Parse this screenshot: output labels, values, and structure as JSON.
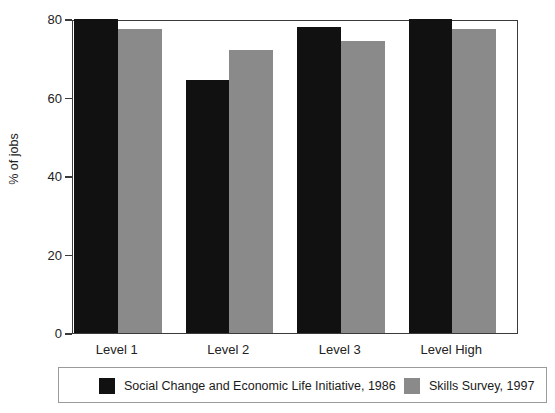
{
  "chart_data": {
    "type": "bar",
    "title": "",
    "subtitle": "",
    "xlabel": "",
    "ylabel": "% of jobs",
    "categories": [
      "Level 1",
      "Level 2",
      "Level 3",
      "Level High"
    ],
    "series": [
      {
        "name": "Social Change and Economic Life Initiative, 1986",
        "color": "#111111",
        "values": [
          80,
          64.5,
          78,
          80
        ]
      },
      {
        "name": "Skills Survey, 1997",
        "color": "#8a8a8a",
        "values": [
          77.5,
          72,
          74.5,
          77.5
        ]
      }
    ],
    "ylim": [
      0,
      80
    ],
    "yticks": [
      0,
      20,
      40,
      60,
      80
    ],
    "ytick_labels": [
      "0",
      "20",
      "40",
      "60",
      "80"
    ],
    "grid": false,
    "legend_position": "bottom"
  },
  "legend": {
    "entries": [
      {
        "label": "Social Change and Economic Life Initiative, 1986",
        "swatch": "black-swatch"
      },
      {
        "label": "Skills Survey, 1997",
        "swatch": "gray-swatch"
      }
    ]
  },
  "colors": {
    "series_1": "#111111",
    "series_2": "#8a8a8a",
    "axis": "#3a3a3a",
    "background": "#ffffff"
  }
}
